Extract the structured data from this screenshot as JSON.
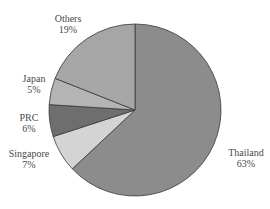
{
  "chart_data": {
    "type": "pie",
    "title": "",
    "unit": "%",
    "slices": [
      {
        "label": "Thailand",
        "value": 63,
        "value_label": "63%",
        "color": "#8c8c8c"
      },
      {
        "label": "Singapore",
        "value": 7,
        "value_label": "7%",
        "color": "#d4d4d4"
      },
      {
        "label": "PRC",
        "value": 6,
        "value_label": "6%",
        "color": "#6e6e6e"
      },
      {
        "label": "Japan",
        "value": 5,
        "value_label": "5%",
        "color": "#b4b4b4"
      },
      {
        "label": "Others",
        "value": 19,
        "value_label": "19%",
        "color": "#a6a6a6"
      }
    ],
    "start_angle": "12 o'clock",
    "direction": "clockwise",
    "legend": "none",
    "labels_position": "outside"
  }
}
